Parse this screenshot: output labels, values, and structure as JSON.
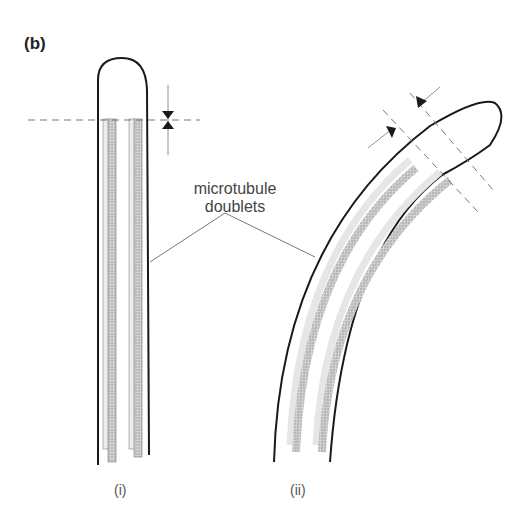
{
  "figure": {
    "panel_label": "(b)",
    "callout_label_line1": "microtubule",
    "callout_label_line2": "doublets",
    "subfigure_i_label": "(i)",
    "subfigure_ii_label": "(ii)",
    "colors": {
      "outline": "#1a1a1a",
      "doublet_fill": "#c8c8c8",
      "doublet_light": "#e6e6e6",
      "dashed": "#777777",
      "leader": "#555555"
    }
  }
}
